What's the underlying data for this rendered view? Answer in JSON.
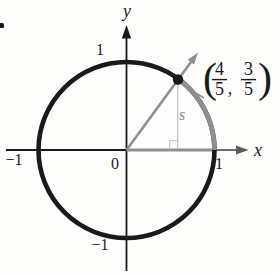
{
  "figure": {
    "bullet_marker": ".",
    "axes": {
      "x_label": "x",
      "y_label": "y",
      "origin_label": "0"
    },
    "ticks": {
      "x_positive": "1",
      "x_negative": "−1",
      "y_positive": "1",
      "y_negative": "−1"
    },
    "arc_label": "s",
    "point_label": {
      "open_paren": "(",
      "numerator_1": "4",
      "denominator_1": "5",
      "comma": ",",
      "numerator_2": "3",
      "denominator_2": "5",
      "close_paren": ")",
      "value_text": "(4/5, 3/5)"
    },
    "colors": {
      "ink": "#1a1a1a",
      "gray": "#8f8f8f",
      "s_gray": "#8e8e8e",
      "axis_arrow_gray": "#5c5c5c",
      "light_gray": "#c7c7c7",
      "background": "#fdfdfb"
    }
  }
}
